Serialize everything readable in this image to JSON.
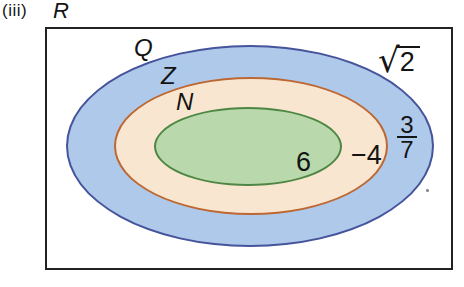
{
  "figure": {
    "item_label": "(iii)",
    "universal_set": {
      "label": "R"
    },
    "sets": [
      {
        "id": "Q",
        "label": "Q",
        "fill": "#afc9ea",
        "border": "#45549b"
      },
      {
        "id": "Z",
        "label": "Z",
        "fill": "#f9e6d0",
        "border": "#bd6833"
      },
      {
        "id": "N",
        "label": "N",
        "fill": "#b9d9ac",
        "border": "#4e8745"
      }
    ],
    "elements": {
      "sqrt2": {
        "radical": "√",
        "radicand": "2",
        "region": "in R outside Q"
      },
      "fraction": {
        "numerator": "3",
        "denominator": "7",
        "region": "in Q outside Z"
      },
      "neg4": {
        "value": "−4",
        "region": "in Z outside N"
      },
      "six": {
        "value": "6",
        "region": "in N"
      }
    },
    "colors": {
      "rectangle_border": "#222222",
      "text": "#141414",
      "background": "#ffffff"
    }
  }
}
